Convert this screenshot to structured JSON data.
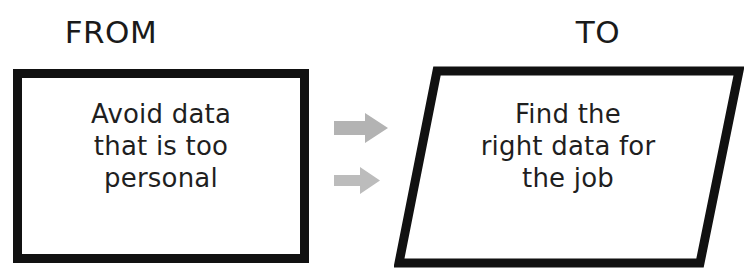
{
  "canvas": {
    "width": 749,
    "height": 280,
    "background": "#ffffff"
  },
  "headings": {
    "from": "FROM",
    "to": "TO"
  },
  "from_box": {
    "shape": "rectangle",
    "border_color": "#111111",
    "border_width_px": 9,
    "fill": "#ffffff",
    "lines": [
      "Avoid data",
      "that is too",
      "personal"
    ],
    "text": "Avoid data that is too personal",
    "text_color": "#1f1f1f"
  },
  "to_box": {
    "shape": "parallelogram",
    "border_color": "#111111",
    "border_width_px": 9,
    "fill": "#ffffff",
    "slant_offset_px": 39,
    "lines": [
      "Find the",
      "right data for",
      "the job"
    ],
    "text": "Find the right data for the job",
    "text_color": "#1f1f1f"
  },
  "arrows": [
    {
      "name": "arrow-top",
      "direction": "right",
      "color": "#b3b3b3",
      "width_px": 54,
      "height_px": 30
    },
    {
      "name": "arrow-bottom",
      "direction": "right",
      "color": "#bcbcbc",
      "width_px": 46,
      "height_px": 27
    }
  ]
}
